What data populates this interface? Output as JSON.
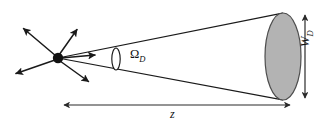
{
  "figure": {
    "name": "scattering-solid-angle-diagram",
    "caption_text": "",
    "background_color": "#ffffff",
    "stroke_color": "#1a1a1a",
    "detector_fill_color": "#b3b3b3",
    "detector_stroke_color": "#4d4d4d"
  },
  "labels": {
    "solid_angle": {
      "symbol": "Ω",
      "subscript": "D",
      "full": "ΩD"
    },
    "detector_width": {
      "symbol": "W",
      "subscript": "D",
      "full": "WD"
    },
    "distance": {
      "symbol": "z",
      "subscript": "",
      "full": "z"
    }
  },
  "elements": {
    "scattering_point": "scattering-point-dot",
    "scattered_rays": [
      "ray-upper-left",
      "ray-upper-right",
      "ray-lower-left",
      "ray-lower-right",
      "ray-into-detector"
    ],
    "cone": "acceptance-cone",
    "aperture": "solid-angle-aperture-ellipse",
    "detector": "detector-disk",
    "width_dimension": "detector-width-dimension-arrow",
    "distance_dimension": "distance-dimension-arrow"
  },
  "geometry": {
    "canvas": {
      "width": 325,
      "height": 124
    },
    "scattering_point": {
      "x": 58,
      "y": 58,
      "r": 5.2
    },
    "detector_ellipse": {
      "cx": 283,
      "cy": 56.5,
      "rx": 18,
      "ry": 43.5
    },
    "aperture_ellipse": {
      "cx": 116,
      "cy": 59,
      "rx": 4.2,
      "ry": 11
    },
    "width_arrow": {
      "x": 305,
      "y_top": 13,
      "y_bottom": 100
    },
    "distance_arrow": {
      "y": 105,
      "x_left": 62,
      "x_right": 292
    }
  }
}
